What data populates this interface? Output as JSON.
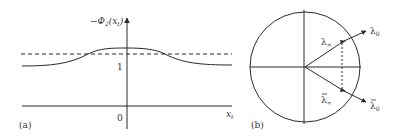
{
  "panel_a": {
    "label": "(a)",
    "y_axis_label_prefix": "−Φ",
    "y_axis_label_sub": "2",
    "y_axis_label_arg": "(x",
    "y_axis_label_arg_sub": "t",
    "y_axis_label_close": ")",
    "x_axis_label": "x",
    "x_axis_label_sub": "t",
    "tick_one": "1",
    "tick_zero": "0"
  },
  "panel_b": {
    "label": "(b)",
    "lambda_inf": "λ",
    "lambda_inf_sub": "∞",
    "lambda_0": "λ",
    "lambda_0_sub": "0",
    "lambda_inf_bar": "λ",
    "lambda_inf_bar_sub": "∞",
    "lambda_0_bar": "λ",
    "lambda_0_bar_sub": "0"
  },
  "colors": {
    "stroke": "#2a2a2a",
    "text": "#333333"
  }
}
